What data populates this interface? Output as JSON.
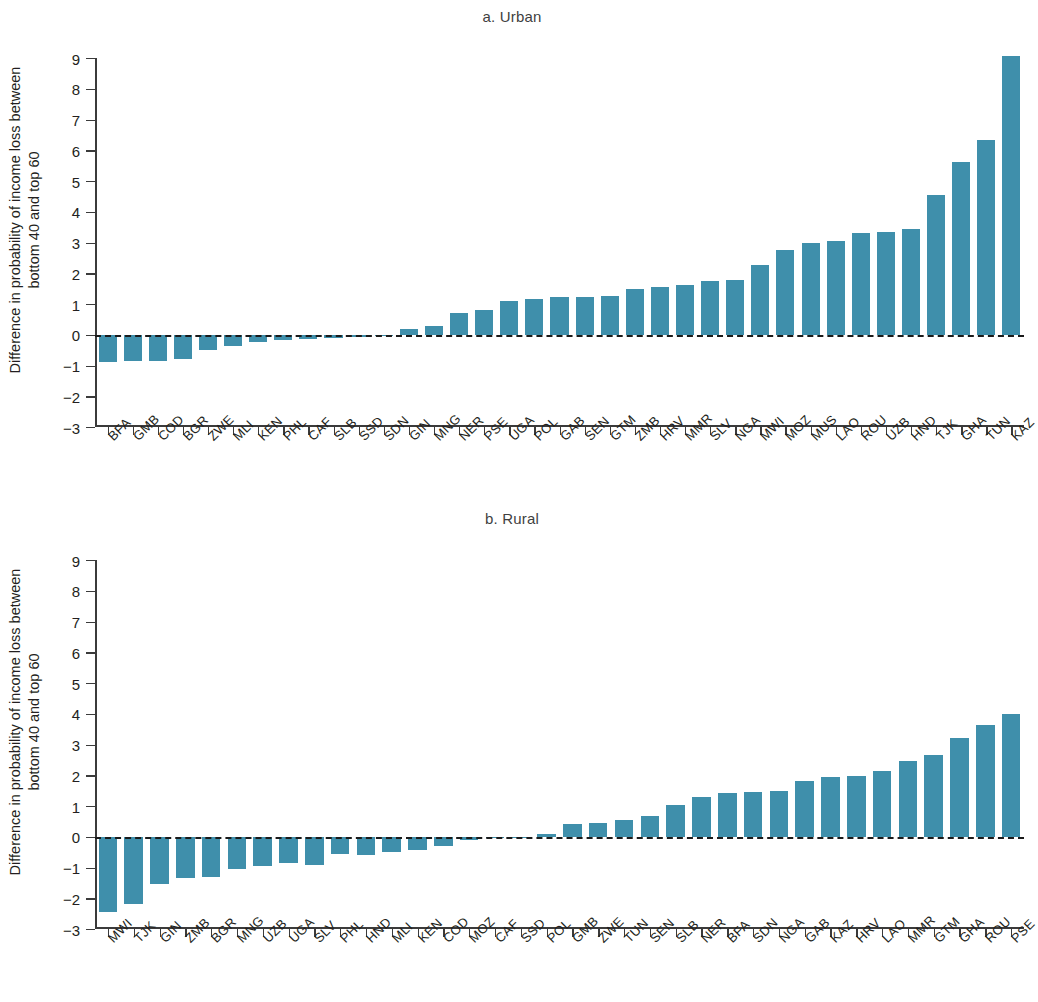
{
  "figure": {
    "y_axis_label": "Difference in probability of income loss between bottom 40 and top 60",
    "y_axis_label_line1": "Difference in probability of income loss between",
    "y_axis_label_line2": "bottom 40 and top 60",
    "bar_color": "#3f8fab",
    "axis_color": "#3b3b3b",
    "zero_line_style": "dashed"
  },
  "chart_data": [
    {
      "type": "bar",
      "title": "a. Urban",
      "xlabel": "",
      "ylabel": "Difference in probability of income loss between bottom 40 and top 60",
      "ylim": [
        -3,
        9
      ],
      "yticks": [
        9,
        8,
        7,
        6,
        5,
        4,
        3,
        2,
        1,
        0,
        -1,
        -2,
        -3
      ],
      "ytick_labels": [
        "9",
        "8",
        "7",
        "6",
        "5",
        "4",
        "3",
        "2",
        "1",
        "0",
        "−1",
        "−2",
        "−3"
      ],
      "grid": false,
      "legend": "none",
      "zero_reference_line": 0,
      "categories": [
        "BFA",
        "GMB",
        "COD",
        "BGR",
        "ZWE",
        "MLI",
        "KEN",
        "PHL",
        "CAF",
        "SLB",
        "SSD",
        "SDN",
        "GIN",
        "MNG",
        "NER",
        "PSE",
        "UGA",
        "POL",
        "GAB",
        "SEN",
        "GTM",
        "ZMB",
        "HRV",
        "MMR",
        "SLV",
        "NGA",
        "MWI",
        "MOZ",
        "MUS",
        "LAO",
        "ROU",
        "UZB",
        "HND",
        "TJK",
        "GHA",
        "TUN",
        "KAZ"
      ],
      "values": [
        -0.9,
        -0.85,
        -0.85,
        -0.8,
        -0.5,
        -0.38,
        -0.22,
        -0.18,
        -0.15,
        -0.1,
        -0.08,
        -0.05,
        0.18,
        0.3,
        0.7,
        0.8,
        1.1,
        1.17,
        1.22,
        1.23,
        1.25,
        1.5,
        1.55,
        1.63,
        1.75,
        1.77,
        2.27,
        2.75,
        3.0,
        3.05,
        3.3,
        3.35,
        3.45,
        4.55,
        5.62,
        6.32,
        9.08
      ]
    },
    {
      "type": "bar",
      "title": "b. Rural",
      "xlabel": "",
      "ylabel": "Difference in probability of income loss between bottom 40 and top 60",
      "ylim": [
        -3,
        9
      ],
      "yticks": [
        9,
        8,
        7,
        6,
        5,
        4,
        3,
        2,
        1,
        0,
        -1,
        -2,
        -3
      ],
      "ytick_labels": [
        "9",
        "8",
        "7",
        "6",
        "5",
        "4",
        "3",
        "2",
        "1",
        "0",
        "−1",
        "−2",
        "−3"
      ],
      "grid": false,
      "legend": "none",
      "zero_reference_line": 0,
      "categories": [
        "MWI",
        "TJK",
        "GIN",
        "ZMB",
        "BGR",
        "MNG",
        "UZB",
        "UGA",
        "SLV",
        "PHL",
        "HND",
        "MLI",
        "KEN",
        "COD",
        "MOZ",
        "CAF",
        "SSD",
        "POL",
        "GMB",
        "ZWE",
        "TUN",
        "SEN",
        "SLB",
        "NER",
        "BFA",
        "SDN",
        "NGA",
        "GAB",
        "KAZ",
        "HRV",
        "LAO",
        "MMR",
        "GTM",
        "GHA",
        "ROU",
        "PSE"
      ],
      "values": [
        -2.45,
        -2.2,
        -1.55,
        -1.35,
        -1.3,
        -1.05,
        -0.95,
        -0.85,
        -0.92,
        -0.55,
        -0.6,
        -0.5,
        -0.42,
        -0.3,
        -0.1,
        -0.05,
        -0.02,
        0.1,
        0.42,
        0.45,
        0.55,
        0.68,
        1.02,
        1.3,
        1.42,
        1.45,
        1.5,
        1.82,
        1.95,
        1.98,
        2.15,
        2.45,
        2.65,
        3.2,
        3.65,
        3.98
      ]
    }
  ]
}
